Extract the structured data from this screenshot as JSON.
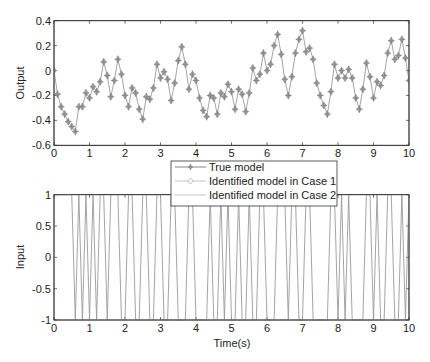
{
  "chart_data": [
    {
      "type": "line",
      "title": "",
      "xlabel": "",
      "ylabel": "Output",
      "xlim": [
        0,
        10
      ],
      "ylim": [
        -0.6,
        0.4
      ],
      "xticks": [
        0,
        1,
        2,
        3,
        4,
        5,
        6,
        7,
        8,
        9,
        10
      ],
      "yticks": [
        0.4,
        0.2,
        0,
        -0.2,
        -0.4,
        -0.6
      ],
      "ytick_labels": [
        "0.4",
        "0.2",
        "0",
        "-0.2",
        "-0.4",
        "-0.6"
      ],
      "grid": false,
      "x": [
        0,
        0.1,
        0.2,
        0.3,
        0.4,
        0.5,
        0.6,
        0.7,
        0.8,
        0.9,
        1.0,
        1.1,
        1.2,
        1.3,
        1.4,
        1.5,
        1.6,
        1.7,
        1.8,
        1.9,
        2.0,
        2.1,
        2.2,
        2.3,
        2.4,
        2.5,
        2.6,
        2.7,
        2.8,
        2.9,
        3.0,
        3.1,
        3.2,
        3.3,
        3.4,
        3.5,
        3.6,
        3.7,
        3.8,
        3.9,
        4.0,
        4.1,
        4.2,
        4.3,
        4.4,
        4.5,
        4.6,
        4.7,
        4.8,
        4.9,
        5.0,
        5.1,
        5.2,
        5.3,
        5.4,
        5.5,
        5.6,
        5.7,
        5.8,
        5.9,
        6.0,
        6.1,
        6.2,
        6.3,
        6.4,
        6.5,
        6.6,
        6.7,
        6.8,
        6.9,
        7.0,
        7.1,
        7.2,
        7.3,
        7.4,
        7.5,
        7.6,
        7.7,
        7.8,
        7.9,
        8.0,
        8.1,
        8.2,
        8.3,
        8.4,
        8.5,
        8.6,
        8.7,
        8.8,
        8.9,
        9.0,
        9.1,
        9.2,
        9.3,
        9.4,
        9.5,
        9.6,
        9.7,
        9.8,
        9.9,
        10.0
      ],
      "series": [
        {
          "name": "True model",
          "marker": "star",
          "values": [
            0,
            -0.19,
            -0.29,
            -0.35,
            -0.41,
            -0.45,
            -0.49,
            -0.29,
            -0.29,
            -0.18,
            -0.22,
            -0.13,
            -0.17,
            -0.09,
            0.07,
            -0.04,
            -0.21,
            -0.08,
            0.09,
            -0.03,
            -0.2,
            -0.29,
            -0.14,
            -0.18,
            -0.31,
            -0.39,
            -0.21,
            -0.23,
            -0.14,
            0.05,
            -0.06,
            -0.01,
            -0.07,
            -0.24,
            -0.1,
            0.08,
            0.19,
            0.05,
            -0.15,
            -0.03,
            -0.08,
            -0.22,
            -0.32,
            -0.37,
            -0.2,
            -0.22,
            -0.35,
            -0.18,
            -0.21,
            -0.11,
            -0.17,
            -0.31,
            -0.15,
            -0.19,
            -0.33,
            -0.18,
            0.02,
            -0.08,
            -0.03,
            0.14,
            0.0,
            0.05,
            0.2,
            0.29,
            0.13,
            -0.07,
            -0.2,
            -0.05,
            0.14,
            0.25,
            0.32,
            0.15,
            0.18,
            0.09,
            -0.1,
            -0.2,
            -0.28,
            -0.35,
            -0.17,
            0.05,
            -0.06,
            0.0,
            -0.06,
            0.01,
            -0.06,
            -0.22,
            -0.31,
            -0.15,
            0.06,
            -0.05,
            -0.22,
            -0.09,
            -0.12,
            -0.04,
            0.14,
            0.24,
            0.09,
            0.12,
            0.25,
            0.1,
            -0.08
          ]
        },
        {
          "name": "Identified model in Case 1",
          "marker": "diamond",
          "values": "overlaps True model"
        },
        {
          "name": "Identified model in Case 2",
          "marker": "none",
          "values": "overlaps True model"
        }
      ]
    },
    {
      "type": "line",
      "title": "",
      "xlabel": "Time(s)",
      "ylabel": "Input",
      "xlim": [
        0,
        10
      ],
      "ylim": [
        -1,
        1
      ],
      "xticks": [
        0,
        1,
        2,
        3,
        4,
        5,
        6,
        7,
        8,
        9,
        10
      ],
      "yticks": [
        1,
        0.5,
        0,
        -0.5,
        -1
      ],
      "ytick_labels": [
        "1",
        "0.5",
        "0",
        "-0.5",
        "-1"
      ],
      "grid": false,
      "x": [
        0,
        0.1,
        0.2,
        0.3,
        0.4,
        0.5,
        0.6,
        0.7,
        0.8,
        0.9,
        1.0,
        1.1,
        1.2,
        1.3,
        1.4,
        1.5,
        1.6,
        1.7,
        1.8,
        1.9,
        2.0,
        2.1,
        2.2,
        2.3,
        2.4,
        2.5,
        2.6,
        2.7,
        2.8,
        2.9,
        3.0,
        3.1,
        3.2,
        3.3,
        3.4,
        3.5,
        3.6,
        3.7,
        3.8,
        3.9,
        4.0,
        4.1,
        4.2,
        4.3,
        4.4,
        4.5,
        4.6,
        4.7,
        4.8,
        4.9,
        5.0,
        5.1,
        5.2,
        5.3,
        5.4,
        5.5,
        5.6,
        5.7,
        5.8,
        5.9,
        6.0,
        6.1,
        6.2,
        6.3,
        6.4,
        6.5,
        6.6,
        6.7,
        6.8,
        6.9,
        7.0,
        7.1,
        7.2,
        7.3,
        7.4,
        7.5,
        7.6,
        7.7,
        7.8,
        7.9,
        8.0,
        8.1,
        8.2,
        8.3,
        8.4,
        8.5,
        8.6,
        8.7,
        8.8,
        8.9,
        9.0,
        9.1,
        9.2,
        9.3,
        9.4,
        9.5,
        9.6,
        9.7,
        9.8,
        9.9,
        10.0
      ],
      "series": [
        {
          "name": "Input",
          "values": [
            1,
            1,
            1,
            1,
            1,
            1,
            -1,
            1,
            -1,
            1,
            -1,
            1,
            -1,
            1,
            1,
            -1,
            1,
            1,
            1,
            -1,
            -1,
            1,
            1,
            -1,
            -1,
            1,
            1,
            -1,
            -1,
            1,
            1,
            -1,
            -1,
            1,
            1,
            -1,
            -1,
            -1,
            1,
            1,
            -1,
            -1,
            -1,
            -1,
            1,
            -1,
            -1,
            1,
            -1,
            1,
            -1,
            -1,
            1,
            -1,
            -1,
            1,
            -1,
            -1,
            1,
            1,
            -1,
            -1,
            -1,
            1,
            1,
            1,
            -1,
            1,
            1,
            -1,
            -1,
            1,
            1,
            -1,
            -1,
            -1,
            -1,
            -1,
            1,
            1,
            -1,
            1,
            -1,
            1,
            -1,
            -1,
            -1,
            -1,
            1,
            1,
            -1,
            1,
            -1,
            -1,
            1,
            1,
            -1,
            -1,
            1,
            -1,
            1
          ]
        }
      ]
    }
  ],
  "legend": {
    "position": "between subplots, center",
    "entries": [
      {
        "label": "True model",
        "marker": "star"
      },
      {
        "label": "Identified model in Case 1",
        "marker": "diamond"
      },
      {
        "label": "Identified model in Case 2",
        "marker": "none"
      }
    ]
  },
  "colors": {
    "line": "#9a9a9a",
    "marker": "#8a8a8a",
    "axes": "#333333",
    "text": "#222222"
  },
  "labels": {
    "top_ylabel": "Output",
    "bottom_ylabel": "Input",
    "bottom_xlabel": "Time(s)"
  }
}
